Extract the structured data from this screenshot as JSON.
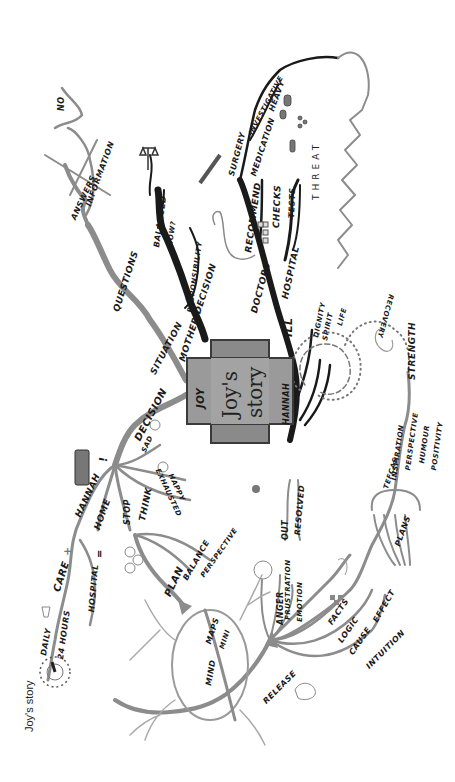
{
  "caption": "Joy's story",
  "central": {
    "title_line1": "Joy's",
    "title_line2": "story",
    "left_label": "JOY",
    "right_label": "HANNAH"
  },
  "branches": {
    "situation": {
      "main": "SITUATION",
      "questions": "QUESTIONS",
      "answers": "ANSWERS",
      "information": "INFORMATION",
      "no": "NO"
    },
    "mother_decision": {
      "main": "MOTHER DECISION",
      "balanced": "BALANCED",
      "how": "HOW?",
      "responsibility": "RESPONSIBILITY"
    },
    "ill": {
      "main": "ILL",
      "doctors": "DOCTORS",
      "recommend": "RECOMMEND",
      "surgery": "SURGERY",
      "investigative": "INVESTIGATIVE",
      "medication": "MEDICATION",
      "heavy": "HEAVY",
      "hospital": "HOSPITAL",
      "checks": "CHECKS",
      "tests": "TESTS",
      "threat": "THREAT",
      "dignity": "DIGNITY",
      "spirit": "SPIRIT",
      "life": "LIFE"
    },
    "recovery": {
      "recovery": "RECOVERY",
      "strength": "STRENGTH",
      "tefcas": "TEFCAS",
      "inspiration": "INSPIRATION",
      "perspective": "PERSPECTIVE",
      "humour": "HUMOUR",
      "positivity": "POSITIVITY",
      "plans": "PLANS"
    },
    "plans_detail": {
      "facts": "FACTS",
      "logic": "LOGIC",
      "cause": "CAUSE",
      "effect": "EFFECT",
      "intuition": "INTUITION"
    },
    "release": {
      "release": "RELEASE",
      "anger": "ANGER",
      "frustration": "FRUSTRATION",
      "emotion": "EMOTION",
      "out": "OUT",
      "resolved": "RESOLVED"
    },
    "decision": {
      "main": "DECISION",
      "exclaim": "!",
      "sad": "SAD",
      "exhausted": "EXHAUSTED",
      "happy": "HAPPY",
      "stop": "STOP",
      "think": "THINK",
      "hannah": "HANNAH",
      "home": "HOME",
      "equals": "=",
      "hospital": "HOSPITAL",
      "care": "CARE",
      "plus": "+",
      "daily": "DAILY",
      "hours": "24 HOURS",
      "plan": "PLAN",
      "balance": "BALANCE",
      "perspective": "PERSPECTIVE",
      "mind": "MIND",
      "maps": "MAPS",
      "mini": "MINI"
    }
  },
  "colors": {
    "background": "#ffffff",
    "branch_grey": "#8c8c8c",
    "branch_dark": "#1a1a1a",
    "central_fill": "#9a9a9a",
    "ink": "#1a1a1a"
  }
}
